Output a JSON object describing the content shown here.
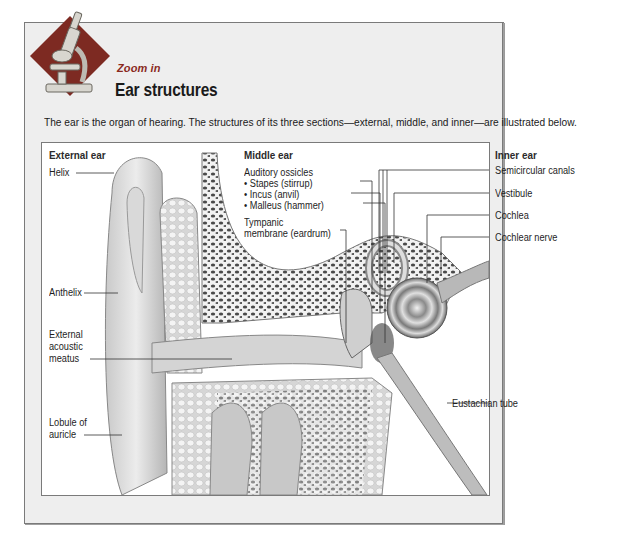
{
  "header": {
    "kicker": "Zoom in",
    "title": "Ear structures",
    "intro": "The ear is the organ of hearing. The structures of its three sections—external, middle, and inner—are illustrated below.",
    "badge_icon": "microscope-icon",
    "badge_color": "#7d2a22"
  },
  "diagram": {
    "sections": {
      "external": "External ear",
      "middle": "Middle ear",
      "inner": "Inner ear"
    },
    "external_labels": {
      "helix": "Helix",
      "anthelix": "Anthelix",
      "meatus_1": "External",
      "meatus_2": "acoustic",
      "meatus_3": "meatus",
      "lobule_1": "Lobule of",
      "lobule_2": "auricle"
    },
    "middle_labels": {
      "ossicles": "Auditory ossicles",
      "stapes": "• Stapes (stirrup)",
      "incus": "• Incus (anvil)",
      "malleus": "• Malleus (hammer)",
      "tympanic_1": "Tympanic",
      "tympanic_2": "membrane (eardrum)"
    },
    "inner_labels": {
      "semicircular": "Semicircular canals",
      "vestibule": "Vestibule",
      "cochlea": "Cochlea",
      "cochlear_nerve": "Cochlear nerve",
      "eustachian": "Eustachian tube"
    }
  }
}
